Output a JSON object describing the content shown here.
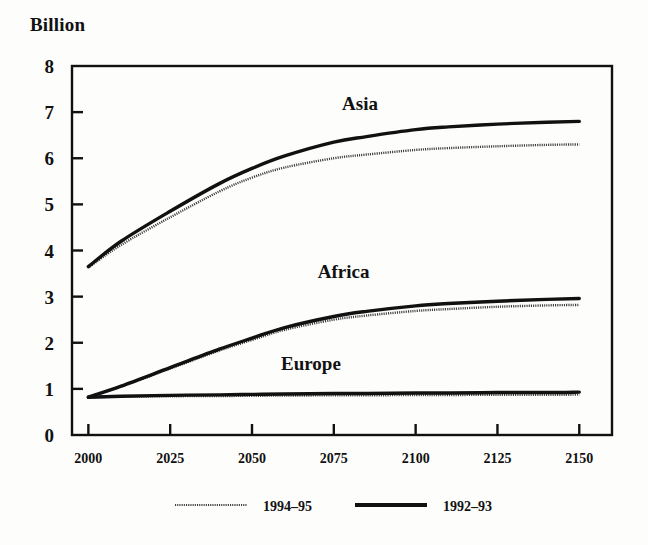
{
  "chart_data": {
    "type": "line",
    "title": "",
    "ylabel": "Billion",
    "xlabel": "",
    "xlim": [
      1995,
      2160
    ],
    "ylim": [
      0,
      8
    ],
    "grid": false,
    "legend_position": "bottom",
    "yticks": [
      "8",
      "7",
      "6",
      "5",
      "4",
      "3",
      "2",
      "1",
      "0"
    ],
    "ytick_values": [
      8,
      7,
      6,
      5,
      4,
      3,
      2,
      1,
      0
    ],
    "xticks": [
      "2000",
      "2025",
      "2050",
      "2075",
      "2100",
      "2125",
      "2150"
    ],
    "xtick_values": [
      2000,
      2025,
      2050,
      2075,
      2100,
      2125,
      2150
    ],
    "annotations": [
      {
        "text": "Asia",
        "x": 2083,
        "y": 7.05
      },
      {
        "text": "Africa",
        "x": 2078,
        "y": 3.4
      },
      {
        "text": "Europe",
        "x": 2068,
        "y": 1.42
      }
    ],
    "legend": [
      {
        "name": "1994–95",
        "style": "thin-stippled",
        "color": "#3b3b3b"
      },
      {
        "name": "1992–93",
        "style": "thick-solid",
        "color": "#111111"
      }
    ],
    "x": [
      2000,
      2010,
      2025,
      2040,
      2050,
      2060,
      2075,
      2085,
      2100,
      2110,
      2125,
      2140,
      2150
    ],
    "series": [
      {
        "name": "Asia 1992–93",
        "region": "Asia",
        "variant": "1992–93",
        "style": "thick-solid",
        "color": "#111111",
        "values": [
          3.65,
          4.2,
          4.85,
          5.45,
          5.78,
          6.05,
          6.35,
          6.47,
          6.62,
          6.68,
          6.74,
          6.78,
          6.8
        ]
      },
      {
        "name": "Asia 1994–95",
        "region": "Asia",
        "variant": "1994–95",
        "style": "thin-stippled",
        "color": "#3b3b3b",
        "values": [
          3.63,
          4.12,
          4.72,
          5.28,
          5.58,
          5.8,
          6.0,
          6.08,
          6.18,
          6.22,
          6.26,
          6.29,
          6.3
        ]
      },
      {
        "name": "Africa 1992–93",
        "region": "Africa",
        "variant": "1992–93",
        "style": "thick-solid",
        "color": "#111111",
        "values": [
          0.82,
          1.06,
          1.46,
          1.86,
          2.1,
          2.33,
          2.57,
          2.68,
          2.8,
          2.85,
          2.9,
          2.94,
          2.96
        ]
      },
      {
        "name": "Africa 1994–95",
        "region": "Africa",
        "variant": "1994–95",
        "style": "thin-stippled",
        "color": "#3b3b3b",
        "values": [
          0.82,
          1.05,
          1.44,
          1.83,
          2.06,
          2.28,
          2.5,
          2.59,
          2.69,
          2.73,
          2.78,
          2.81,
          2.82
        ]
      },
      {
        "name": "Europe 1992–93",
        "region": "Europe",
        "variant": "1992–93",
        "style": "thick-solid",
        "color": "#111111",
        "values": [
          0.82,
          0.84,
          0.86,
          0.87,
          0.88,
          0.89,
          0.9,
          0.9,
          0.91,
          0.91,
          0.92,
          0.92,
          0.93
        ]
      },
      {
        "name": "Europe 1994–95",
        "region": "Europe",
        "variant": "1994–95",
        "style": "thin-stippled",
        "color": "#3b3b3b",
        "values": [
          0.82,
          0.83,
          0.84,
          0.845,
          0.85,
          0.855,
          0.86,
          0.862,
          0.865,
          0.868,
          0.87,
          0.872,
          0.875
        ]
      }
    ]
  }
}
